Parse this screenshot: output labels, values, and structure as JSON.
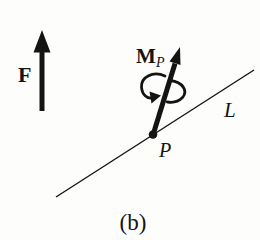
{
  "figure": {
    "caption": "(b)",
    "labels": {
      "force": "F",
      "moment": "M",
      "moment_subscript": "P",
      "line": "L",
      "point": "P"
    },
    "colors": {
      "ink": "#141414",
      "background": "#fdfdfc"
    }
  }
}
